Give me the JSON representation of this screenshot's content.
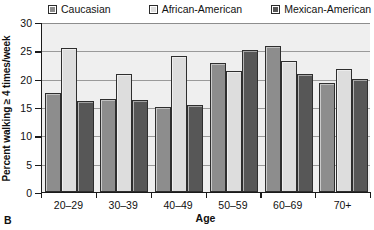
{
  "panel": {
    "label": "B"
  },
  "legend": {
    "position": "top",
    "entries": [
      {
        "label": "Caucasian",
        "color": "#8d8d8d"
      },
      {
        "label": "African-American",
        "color": "#dddddd"
      },
      {
        "label": "Mexican-American",
        "color": "#575757"
      }
    ]
  },
  "axes": {
    "xlabel": "Age",
    "ylabel": "Percent walking ≥ 4 times/week",
    "yticks": [
      "0",
      "5",
      "10",
      "15",
      "20",
      "25",
      "30"
    ],
    "xticks": [
      "20–29",
      "30–39",
      "40–49",
      "50–59",
      "60–69",
      "70+"
    ]
  },
  "chart_data": {
    "type": "bar",
    "title": "",
    "subtitle": "",
    "xlabel": "Age",
    "ylabel": "Percent walking ≥ 4 times/week",
    "ylim": [
      0,
      30
    ],
    "ytick_values": [
      0,
      5,
      10,
      15,
      20,
      25,
      30
    ],
    "grid": true,
    "grid_axis": "y",
    "legend_position": "top",
    "categories": [
      "20–29",
      "30–39",
      "40–49",
      "50–59",
      "60–69",
      "70+"
    ],
    "series": [
      {
        "name": "Caucasian",
        "color": "#8d8d8d",
        "values": [
          17.5,
          16.5,
          15.0,
          22.8,
          25.7,
          19.3
        ]
      },
      {
        "name": "African-American",
        "color": "#dddddd",
        "values": [
          25.5,
          20.8,
          24.0,
          21.3,
          23.2,
          21.7
        ]
      },
      {
        "name": "Mexican-American",
        "color": "#575757",
        "values": [
          16.0,
          16.3,
          15.4,
          25.0,
          20.8,
          20.0
        ]
      }
    ],
    "annotations": [
      {
        "text": "B",
        "position": "bottom-left",
        "role": "panel-label"
      }
    ]
  }
}
